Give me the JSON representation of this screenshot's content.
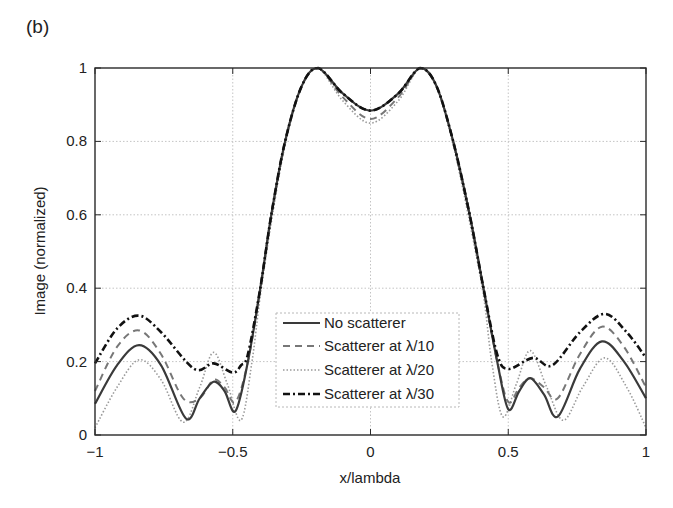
{
  "panel_label": "(b)",
  "chart_data": {
    "type": "line",
    "title": "",
    "xlabel": "x/lambda",
    "ylabel": "Image (normalized)",
    "xlim": [
      -1,
      1
    ],
    "ylim": [
      0,
      1
    ],
    "grid": true,
    "legend_position": "lower center (inside axes)",
    "xticks": [
      -1,
      -0.5,
      0,
      0.5,
      1
    ],
    "xtick_labels": [
      "−1",
      "−0.5",
      "0",
      "0.5",
      "1"
    ],
    "yticks": [
      0,
      0.2,
      0.4,
      0.6,
      0.8,
      1
    ],
    "ytick_labels": [
      "0",
      "0.2",
      "0.4",
      "0.6",
      "0.8",
      "1"
    ],
    "series": [
      {
        "name": "No scatterer",
        "style": "solid",
        "color": "#3a3a3a",
        "width": 2.2,
        "x": [
          -1,
          -0.92,
          -0.84,
          -0.76,
          -0.67,
          -0.62,
          -0.57,
          -0.53,
          -0.49,
          -0.445,
          -0.4,
          -0.36,
          -0.31,
          -0.25,
          -0.19,
          -0.1,
          0,
          0.1,
          0.18,
          0.24,
          0.3,
          0.36,
          0.41,
          0.46,
          0.5,
          0.54,
          0.58,
          0.63,
          0.68,
          0.76,
          0.84,
          0.92,
          1
        ],
        "y": [
          0.085,
          0.19,
          0.245,
          0.19,
          0.045,
          0.1,
          0.145,
          0.12,
          0.065,
          0.2,
          0.4,
          0.6,
          0.8,
          0.95,
          1.0,
          0.93,
          0.884,
          0.93,
          1.0,
          0.95,
          0.8,
          0.6,
          0.4,
          0.2,
          0.07,
          0.12,
          0.155,
          0.11,
          0.05,
          0.18,
          0.255,
          0.2,
          0.1
        ]
      },
      {
        "name": "Scatterer at λ/10",
        "style": "dashed",
        "color": "#777777",
        "width": 2.0,
        "x": [
          -1,
          -0.92,
          -0.84,
          -0.76,
          -0.68,
          -0.62,
          -0.57,
          -0.53,
          -0.49,
          -0.445,
          -0.4,
          -0.36,
          -0.31,
          -0.25,
          -0.19,
          -0.1,
          0,
          0.1,
          0.18,
          0.24,
          0.3,
          0.36,
          0.41,
          0.46,
          0.5,
          0.54,
          0.58,
          0.63,
          0.68,
          0.76,
          0.84,
          0.92,
          1
        ],
        "y": [
          0.12,
          0.24,
          0.285,
          0.22,
          0.1,
          0.1,
          0.15,
          0.13,
          0.09,
          0.2,
          0.4,
          0.6,
          0.8,
          0.95,
          1.0,
          0.92,
          0.861,
          0.92,
          1.0,
          0.95,
          0.8,
          0.6,
          0.4,
          0.2,
          0.09,
          0.13,
          0.155,
          0.13,
          0.1,
          0.22,
          0.295,
          0.24,
          0.13
        ]
      },
      {
        "name": "Scatterer at λ/20",
        "style": "dotted",
        "color": "#9a9a9a",
        "width": 1.6,
        "x": [
          -1,
          -0.92,
          -0.84,
          -0.76,
          -0.68,
          -0.62,
          -0.57,
          -0.52,
          -0.47,
          -0.43,
          -0.4,
          -0.36,
          -0.31,
          -0.25,
          -0.19,
          -0.1,
          0,
          0.1,
          0.18,
          0.24,
          0.3,
          0.36,
          0.41,
          0.44,
          0.48,
          0.53,
          0.58,
          0.64,
          0.7,
          0.77,
          0.85,
          0.93,
          1
        ],
        "y": [
          0.02,
          0.13,
          0.205,
          0.15,
          0.035,
          0.13,
          0.225,
          0.14,
          0.04,
          0.2,
          0.38,
          0.58,
          0.79,
          0.95,
          1.0,
          0.91,
          0.85,
          0.91,
          1.0,
          0.95,
          0.79,
          0.58,
          0.38,
          0.2,
          0.05,
          0.14,
          0.23,
          0.13,
          0.04,
          0.13,
          0.21,
          0.13,
          0.02
        ]
      },
      {
        "name": "Scatterer at λ/30",
        "style": "dashdot",
        "color": "#111111",
        "width": 2.6,
        "x": [
          -1,
          -0.92,
          -0.84,
          -0.76,
          -0.64,
          -0.57,
          -0.5,
          -0.47,
          -0.445,
          -0.4,
          -0.36,
          -0.31,
          -0.25,
          -0.19,
          -0.1,
          0,
          0.1,
          0.18,
          0.24,
          0.3,
          0.36,
          0.41,
          0.46,
          0.5,
          0.59,
          0.66,
          0.76,
          0.85,
          0.93,
          1
        ],
        "y": [
          0.195,
          0.29,
          0.325,
          0.28,
          0.18,
          0.195,
          0.17,
          0.19,
          0.22,
          0.4,
          0.6,
          0.8,
          0.95,
          1.0,
          0.93,
          0.884,
          0.93,
          1.0,
          0.95,
          0.8,
          0.6,
          0.4,
          0.22,
          0.18,
          0.21,
          0.19,
          0.28,
          0.33,
          0.28,
          0.21
        ]
      }
    ]
  }
}
